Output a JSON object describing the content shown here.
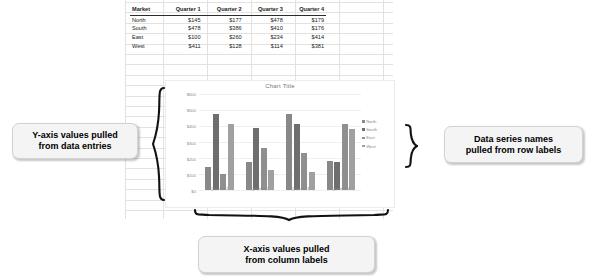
{
  "spreadsheet": {
    "table": {
      "headers": [
        "Market",
        "Quarter 1",
        "Quarter 2",
        "Quarter 3",
        "Quarter 4"
      ],
      "rows": [
        {
          "market": "North",
          "q1": "$145",
          "q2": "$177",
          "q3": "$478",
          "q4": "$179"
        },
        {
          "market": "South",
          "q1": "$478",
          "q2": "$386",
          "q3": "$410",
          "q4": "$176"
        },
        {
          "market": "East",
          "q1": "$100",
          "q2": "$260",
          "q3": "$234",
          "q4": "$414"
        },
        {
          "market": "West",
          "q1": "$411",
          "q2": "$128",
          "q3": "$114",
          "q4": "$381"
        }
      ]
    }
  },
  "chart_data": {
    "type": "bar",
    "title": "Chart Title",
    "categories": [
      "Quarter 1",
      "Quarter 2",
      "Quarter 3",
      "Quarter 4"
    ],
    "series": [
      {
        "name": "North",
        "values": [
          145,
          177,
          478,
          179
        ],
        "color": "#888888"
      },
      {
        "name": "South",
        "values": [
          478,
          386,
          410,
          176
        ],
        "color": "#6e6e6e"
      },
      {
        "name": "East",
        "values": [
          100,
          260,
          234,
          414
        ],
        "color": "#8f8f8f"
      },
      {
        "name": "West",
        "values": [
          411,
          128,
          114,
          381
        ],
        "color": "#a0a0a0"
      }
    ],
    "ytick_labels": [
      "$0",
      "$100",
      "$200",
      "$300",
      "$400",
      "$500",
      "$600"
    ],
    "ytick_values": [
      0,
      100,
      200,
      300,
      400,
      500,
      600
    ],
    "ylim": [
      0,
      600
    ],
    "xlabel": "",
    "ylabel": "",
    "grid": true,
    "legend_position": "right"
  },
  "annotations": {
    "y_axis": "Y-axis values pulled\nfrom data entries",
    "series_names": "Data series names\npulled from row labels",
    "x_axis": "X-axis values pulled\nfrom column labels"
  }
}
